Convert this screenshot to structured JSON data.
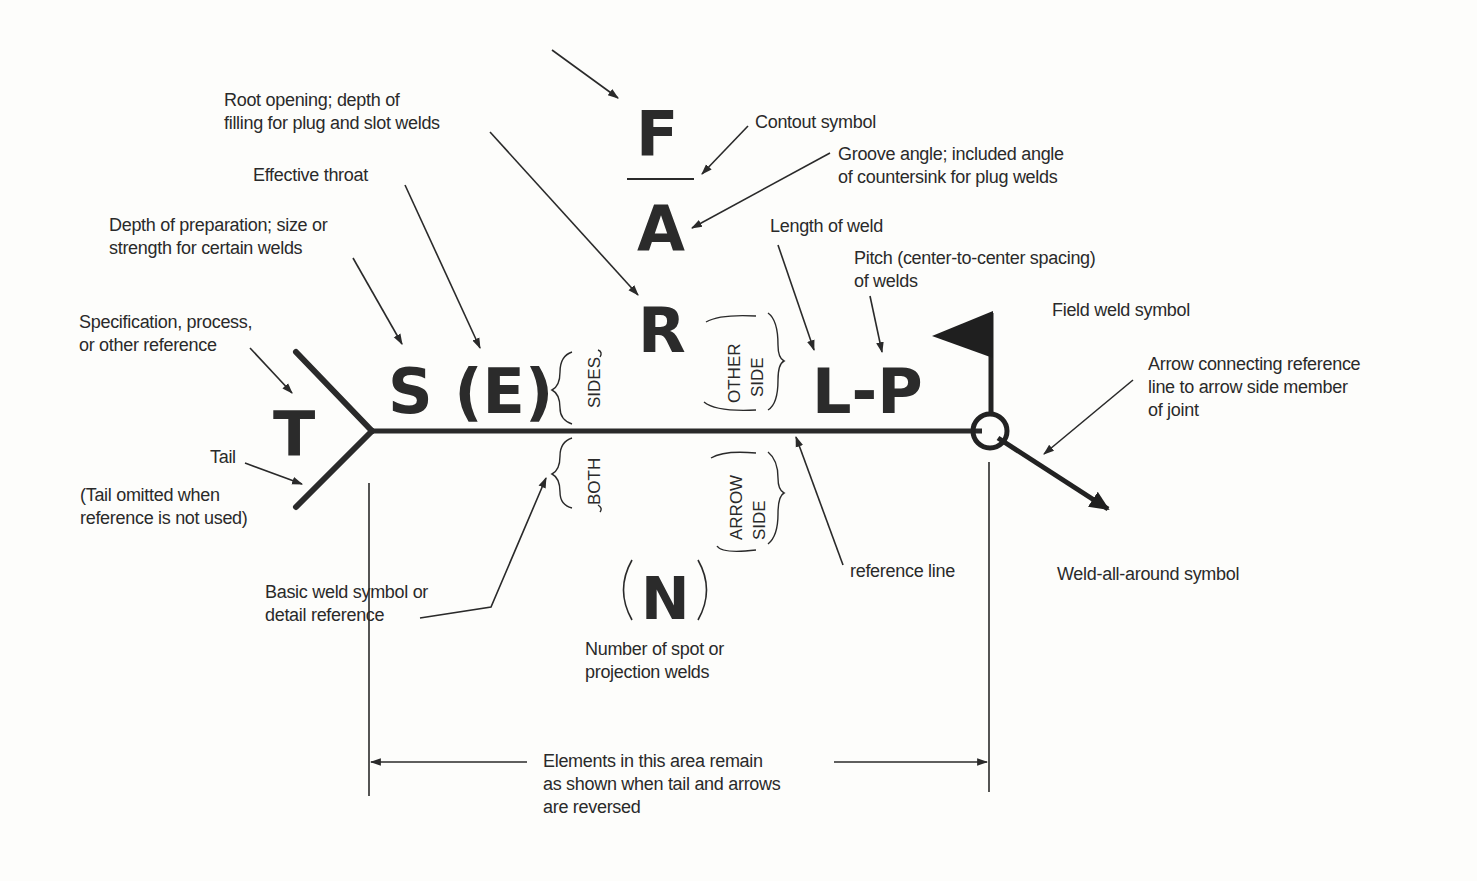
{
  "symbol_letters": {
    "F": "F",
    "A": "A",
    "R": "R",
    "S_E": "S (E)",
    "T": "T",
    "L_P": "L-P",
    "N": "N"
  },
  "brace_labels": {
    "both": "BOTH",
    "sides": "SIDES",
    "other": "OTHER",
    "other_side": "SIDE",
    "arrow": "ARROW",
    "arrow_side": "SIDE"
  },
  "annotations": {
    "root_opening": [
      "Root opening; depth of",
      "filling for plug and slot welds"
    ],
    "contour": [
      "Contout symbol"
    ],
    "groove_angle": [
      "Groove angle; included angle",
      "of countersink for plug welds"
    ],
    "effective_throat": [
      "Effective throat"
    ],
    "depth_prep": [
      "Depth of preparation; size or",
      "strength for certain welds"
    ],
    "length": [
      "Length of weld"
    ],
    "pitch": [
      "Pitch (center-to-center spacing)",
      "of welds"
    ],
    "field_weld": [
      "Field weld symbol"
    ],
    "specification": [
      "Specification, process,",
      "or other reference"
    ],
    "arrow_connecting": [
      "Arrow connecting reference",
      "line to arrow side member",
      "of joint"
    ],
    "tail": [
      "Tail"
    ],
    "tail_omitted": [
      "(Tail omitted when",
      "reference is not used)"
    ],
    "basic_weld": [
      "Basic weld symbol or",
      "detail reference"
    ],
    "reference_line": [
      "reference line"
    ],
    "weld_all_around": [
      "Weld-all-around symbol"
    ],
    "number_spot": [
      "Number of spot or",
      "projection welds"
    ],
    "elements_area": [
      "Elements in this area remain",
      "as shown when tail and arrows",
      "are reversed"
    ]
  }
}
